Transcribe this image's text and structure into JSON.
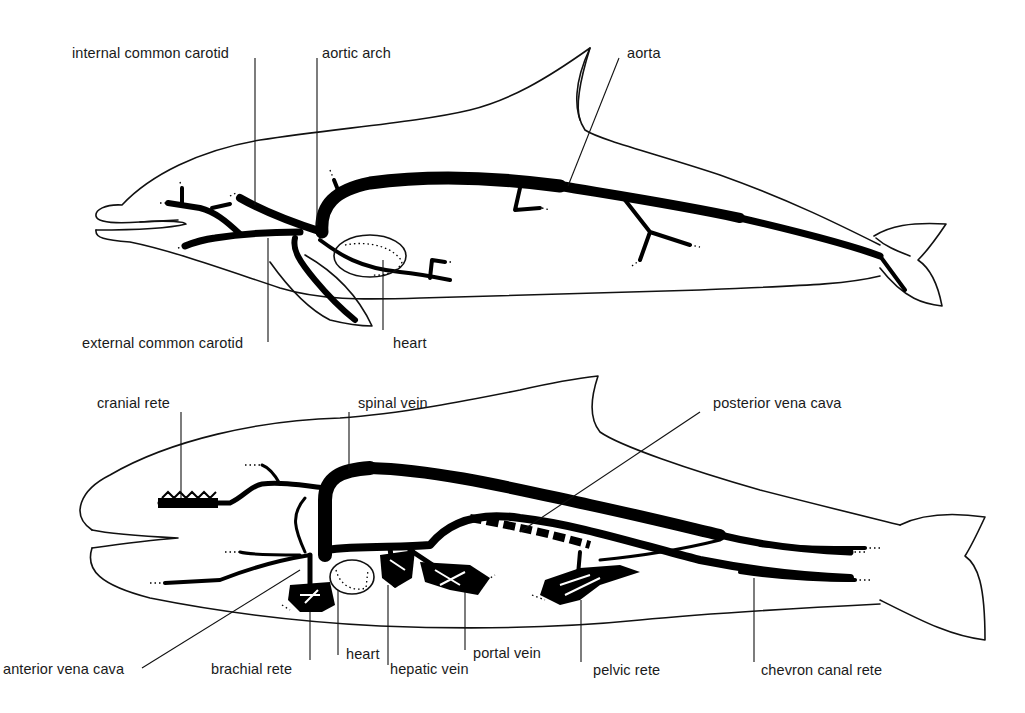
{
  "figure": {
    "panels": [
      {
        "id": "arterial",
        "description": "Dolphin arterial system (lateral view)",
        "labels": {
          "internal_common_carotid": "internal common carotid",
          "aortic_arch": "aortic arch",
          "aorta": "aorta",
          "external_common_carotid": "external common carotid",
          "heart": "heart"
        }
      },
      {
        "id": "venous",
        "description": "Dolphin venous system (lateral view)",
        "labels": {
          "cranial_rete": "cranial rete",
          "spinal_vein": "spinal vein",
          "posterior_vena_cava": "posterior vena cava",
          "anterior_vena_cava": "anterior vena cava",
          "brachial_rete": "brachial rete",
          "heart": "heart",
          "hepatic_vein": "hepatic vein",
          "portal_vein": "portal vein",
          "pelvic_rete": "pelvic rete",
          "chevron_canal_rete": "chevron canal rete"
        }
      }
    ],
    "colors": {
      "ink": "#111111",
      "background": "#ffffff"
    }
  }
}
